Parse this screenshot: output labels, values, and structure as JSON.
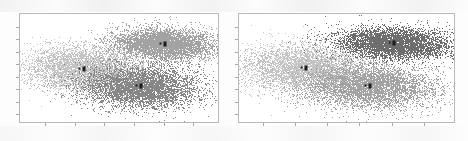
{
  "figure": {
    "title": "",
    "background_color": "#fdfdfd",
    "panel_count": 2
  },
  "chart_data": [
    {
      "type": "scatter",
      "title": "",
      "xlabel": "",
      "ylabel": "",
      "grid": false,
      "legend": "none",
      "xlim": [
        -1.0,
        1.0
      ],
      "ylim": [
        -1.0,
        1.0
      ],
      "xticks": [
        -0.75,
        -0.45,
        -0.15,
        0.15,
        0.45,
        0.75
      ],
      "yticks": [
        -0.85,
        -0.62,
        -0.39,
        -0.16,
        0.07,
        0.3,
        0.53,
        0.76
      ],
      "panel": "left",
      "point_size": 0.9,
      "n_points_per_cluster": 6000,
      "series": [
        {
          "name": "cluster-light",
          "color": "#c4c4c4",
          "centroid": [
            -0.35,
            -0.02
          ],
          "centroid_label": "",
          "spread_x": 0.3,
          "spread_y": 0.21,
          "rotation_deg": -8
        },
        {
          "name": "cluster-dark",
          "color": "#878787",
          "centroid": [
            0.22,
            -0.34
          ],
          "centroid_label": "",
          "spread_x": 0.3,
          "spread_y": 0.2,
          "rotation_deg": -4
        },
        {
          "name": "cluster-medium",
          "color": "#a3a3a3",
          "centroid": [
            0.46,
            0.45
          ],
          "centroid_label": "",
          "spread_x": 0.26,
          "spread_y": 0.14,
          "rotation_deg": -6
        }
      ]
    },
    {
      "type": "scatter",
      "title": "",
      "xlabel": "",
      "ylabel": "",
      "grid": false,
      "legend": "none",
      "xlim": [
        -1.0,
        1.0
      ],
      "ylim": [
        -1.0,
        1.0
      ],
      "xticks": [
        -0.78,
        -0.48,
        -0.18,
        0.12,
        0.42,
        0.72
      ],
      "yticks": [
        -0.85,
        -0.62,
        -0.39,
        -0.16,
        0.07,
        0.3,
        0.53,
        0.76
      ],
      "panel": "right",
      "point_size": 0.9,
      "n_points_per_cluster": 6000,
      "series": [
        {
          "name": "cluster-light",
          "color": "#c4c4c4",
          "centroid": [
            -0.38,
            0.0
          ],
          "centroid_label": "",
          "spread_x": 0.3,
          "spread_y": 0.22,
          "rotation_deg": -8
        },
        {
          "name": "cluster-medium",
          "color": "#a3a3a3",
          "centroid": [
            0.22,
            -0.34
          ],
          "centroid_label": "",
          "spread_x": 0.31,
          "spread_y": 0.2,
          "rotation_deg": -4
        },
        {
          "name": "cluster-dark",
          "color": "#6e6e6e",
          "centroid": [
            0.44,
            0.46
          ],
          "centroid_label": "",
          "spread_x": 0.26,
          "spread_y": 0.14,
          "rotation_deg": -6
        }
      ]
    }
  ],
  "panels": [
    {
      "name": "left-scatter-panel",
      "frame_color": "#b9b9b9"
    },
    {
      "name": "right-scatter-panel",
      "frame_color": "#b9b9b9"
    }
  ]
}
